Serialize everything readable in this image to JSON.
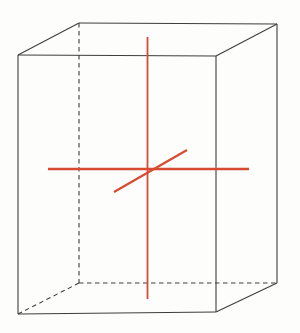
{
  "figure": {
    "kind": "wireframe-cuboid-with-axes",
    "canvas": {
      "width": 300,
      "height": 333,
      "background": "#fdfdfc"
    },
    "style": {
      "edge_color": "#3e3e3e",
      "edge_width": 1.1,
      "dash_pattern": "4.5 3.5",
      "axis_color": "#d64b32"
    },
    "box": {
      "vertices": {
        "top_front_left": [
          18,
          55
        ],
        "top_front_right": [
          216,
          56
        ],
        "top_back_right": [
          277,
          24
        ],
        "top_back_left": [
          79,
          23
        ],
        "bottom_front_left": [
          18,
          314
        ],
        "bottom_front_right": [
          216,
          312
        ],
        "bottom_back_right": [
          277,
          283
        ],
        "bottom_back_left": [
          79,
          283
        ]
      },
      "solid_edges": [
        [
          "top_front_left",
          "top_front_right"
        ],
        [
          "top_front_right",
          "top_back_right"
        ],
        [
          "top_back_right",
          "top_back_left"
        ],
        [
          "top_back_left",
          "top_front_left"
        ],
        [
          "top_front_left",
          "bottom_front_left"
        ],
        [
          "top_front_right",
          "bottom_front_right"
        ],
        [
          "top_back_right",
          "bottom_back_right"
        ],
        [
          "bottom_front_left",
          "bottom_front_right"
        ],
        [
          "bottom_front_right",
          "bottom_back_right"
        ]
      ],
      "dashed_edges": [
        [
          "top_back_left",
          "bottom_back_left"
        ],
        [
          "bottom_back_left",
          "bottom_back_right"
        ],
        [
          "bottom_back_left",
          "bottom_front_left"
        ]
      ]
    },
    "axes": {
      "vertical": {
        "x1": 147.5,
        "y1": 37,
        "x2": 147.5,
        "y2": 299,
        "width": 1.8
      },
      "horizontal": {
        "x1": 48,
        "y1": 169,
        "x2": 249,
        "y2": 169,
        "width": 2.4
      },
      "depth": {
        "x1": 114,
        "y1": 192,
        "x2": 187,
        "y2": 150,
        "width": 2.2
      }
    }
  }
}
